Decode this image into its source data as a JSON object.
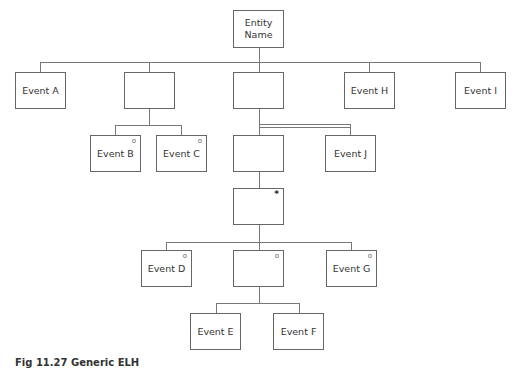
{
  "diagram": {
    "type": "entity-life-history",
    "root": {
      "label": "Entity\nName",
      "line1": "Entity",
      "line2": "Name"
    },
    "nodes": {
      "event_a": {
        "label": "Event A",
        "marker": ""
      },
      "level1_seq_left": {
        "label": "",
        "marker": ""
      },
      "level1_seq_mid": {
        "label": "",
        "marker": ""
      },
      "event_h": {
        "label": "Event H",
        "marker": ""
      },
      "event_i": {
        "label": "Event I",
        "marker": ""
      },
      "event_b": {
        "label": "Event B",
        "marker": "o"
      },
      "event_c": {
        "label": "Event C",
        "marker": "o"
      },
      "level2_sel_box": {
        "label": "",
        "marker": ""
      },
      "event_j": {
        "label": "Event J",
        "marker": ""
      },
      "iteration_box": {
        "label": "",
        "marker": "*"
      },
      "event_d": {
        "label": "Event D",
        "marker": "o"
      },
      "level4_sel_box": {
        "label": "",
        "marker": "o"
      },
      "event_g": {
        "label": "Event G",
        "marker": "o"
      },
      "event_e": {
        "label": "Event E",
        "marker": ""
      },
      "event_f": {
        "label": "Event F",
        "marker": ""
      }
    },
    "caption": "Fig 11.27  Generic ELH"
  }
}
